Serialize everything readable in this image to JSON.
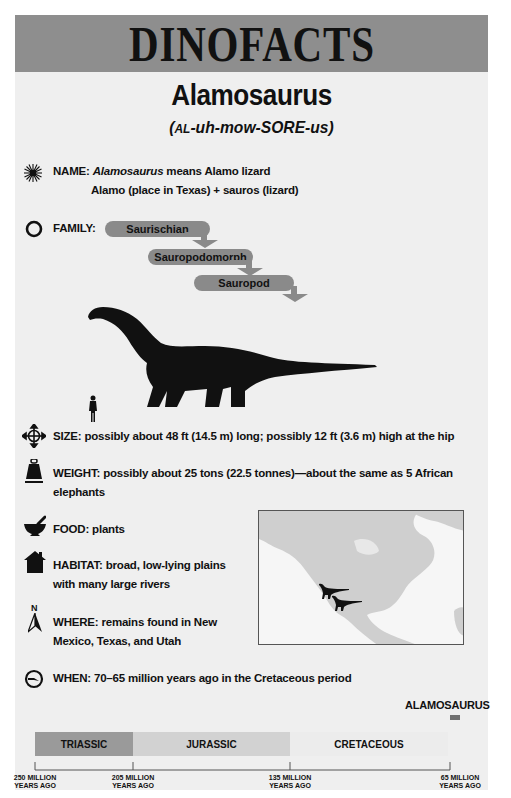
{
  "banner": {
    "title": "DINOFACTS"
  },
  "dinosaur": {
    "name": "Alamosaurus",
    "pronunciation": {
      "open": "(",
      "smallcaps": "AL",
      "rest": "-uh-mow-SORE-us)"
    }
  },
  "facts": {
    "name": {
      "icon": "sunburst-icon",
      "label": "NAME:",
      "italic": "Alamosaurus",
      "text": " means Alamo lizard",
      "line2": "Alamo (place in Texas) + sauros (lizard)"
    },
    "family": {
      "icon": "circle-icon",
      "label": "FAMILY:",
      "levels": [
        "Saurischian",
        "Sauropodomorph",
        "Sauropod"
      ]
    },
    "size": {
      "icon": "four-way-arrows-icon",
      "label": "SIZE:",
      "text": " possibly about 48 ft (14.5 m) long; possibly 12 ft (3.6 m) high at the hip"
    },
    "weight": {
      "icon": "weight-icon",
      "label": "WEIGHT:",
      "text": " possibly about 25 tons (22.5 tonnes)—about the same as 5 African",
      "line2": "elephants"
    },
    "food": {
      "icon": "mortar-pestle-icon",
      "label": "FOOD:",
      "text": " plants"
    },
    "habitat": {
      "icon": "house-icon",
      "label": "HABITAT:",
      "text": " broad, low-lying plains",
      "line2": "with many large rivers"
    },
    "where": {
      "icon": "north-arrow-icon",
      "icon_letter": "N",
      "label": "WHERE:",
      "text": " remains found in New",
      "line2": "Mexico, Texas, and Utah"
    },
    "when": {
      "icon": "clock-icon",
      "label": "WHEN:",
      "text": " 70–65 million years ago in the Cretaceous period"
    }
  },
  "timeline": {
    "marker_label": "ALAMOSAURUS",
    "periods": [
      {
        "name": "TRIASSIC",
        "color": "#9a9a9a"
      },
      {
        "name": "JURASSIC",
        "color": "#d2d2d2"
      },
      {
        "name": "CRETACEOUS",
        "color": "#ececec"
      }
    ],
    "ticks": [
      {
        "line1": "250 MILLION",
        "line2": "YEARS AGO"
      },
      {
        "line1": "205 MILLION",
        "line2": "YEARS AGO"
      },
      {
        "line1": "135 MILLION",
        "line2": "YEARS AGO"
      },
      {
        "line1": "65 MILLION",
        "line2": "YEARS AGO"
      }
    ]
  }
}
